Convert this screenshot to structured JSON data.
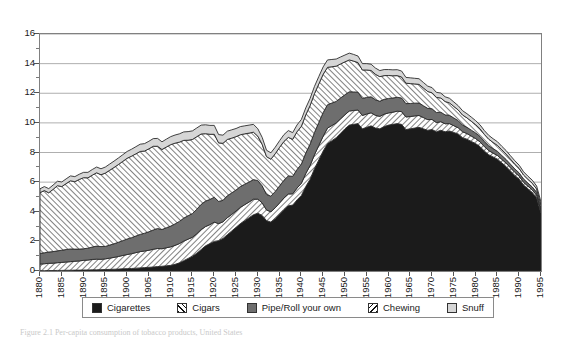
{
  "chart_data": {
    "type": "area",
    "stacked": true,
    "title": "",
    "xlabel": "",
    "ylabel": "",
    "xlim": [
      1880,
      1995
    ],
    "ylim": [
      0,
      16
    ],
    "ytick_major": [
      0,
      2,
      4,
      6,
      8,
      10,
      12,
      14,
      16
    ],
    "ytick_minor": [
      1,
      3,
      5,
      7,
      9,
      11,
      13,
      15
    ],
    "xticks": [
      1880,
      1885,
      1890,
      1895,
      1900,
      1905,
      1910,
      1915,
      1920,
      1925,
      1930,
      1935,
      1940,
      1945,
      1950,
      1955,
      1960,
      1965,
      1970,
      1975,
      1980,
      1985,
      1990,
      1995
    ],
    "grid": "horizontal",
    "legend_position": "below",
    "colors": {
      "cigarettes": "#1b1b1b",
      "cigars": "#ffffff",
      "pipe": "#6e6e6e",
      "chewing": "#ffffff",
      "snuff": "#d6d6d6",
      "frame": "#808080",
      "gridline": "#9a9a9a"
    },
    "x": [
      1880,
      1881,
      1882,
      1883,
      1884,
      1885,
      1886,
      1887,
      1888,
      1889,
      1890,
      1891,
      1892,
      1893,
      1894,
      1895,
      1896,
      1897,
      1898,
      1899,
      1900,
      1901,
      1902,
      1903,
      1904,
      1905,
      1906,
      1907,
      1908,
      1909,
      1910,
      1911,
      1912,
      1913,
      1914,
      1915,
      1916,
      1917,
      1918,
      1919,
      1920,
      1921,
      1922,
      1923,
      1924,
      1925,
      1926,
      1927,
      1928,
      1929,
      1930,
      1931,
      1932,
      1933,
      1934,
      1935,
      1936,
      1937,
      1938,
      1939,
      1940,
      1941,
      1942,
      1943,
      1944,
      1945,
      1946,
      1947,
      1948,
      1949,
      1950,
      1951,
      1952,
      1953,
      1954,
      1955,
      1956,
      1957,
      1958,
      1959,
      1960,
      1961,
      1962,
      1963,
      1964,
      1965,
      1966,
      1967,
      1968,
      1969,
      1970,
      1971,
      1972,
      1973,
      1974,
      1975,
      1976,
      1977,
      1978,
      1979,
      1980,
      1981,
      1982,
      1983,
      1984,
      1985,
      1986,
      1987,
      1988,
      1989,
      1990,
      1991,
      1992,
      1993,
      1994,
      1995
    ],
    "series": [
      {
        "name": "Cigarettes",
        "pattern": "solid-black",
        "values": [
          0.02,
          0.02,
          0.03,
          0.03,
          0.04,
          0.04,
          0.05,
          0.05,
          0.06,
          0.06,
          0.07,
          0.07,
          0.08,
          0.08,
          0.09,
          0.1,
          0.11,
          0.12,
          0.13,
          0.15,
          0.16,
          0.17,
          0.19,
          0.21,
          0.23,
          0.25,
          0.27,
          0.3,
          0.32,
          0.35,
          0.38,
          0.45,
          0.55,
          0.7,
          0.85,
          1.0,
          1.2,
          1.45,
          1.7,
          1.85,
          2.0,
          2.05,
          2.2,
          2.45,
          2.7,
          2.95,
          3.2,
          3.4,
          3.6,
          3.8,
          3.9,
          3.75,
          3.4,
          3.3,
          3.55,
          3.85,
          4.15,
          4.4,
          4.45,
          4.8,
          5.1,
          5.7,
          6.2,
          6.9,
          7.5,
          8.1,
          8.6,
          8.8,
          9.0,
          9.3,
          9.6,
          9.85,
          9.9,
          9.95,
          9.6,
          9.7,
          9.8,
          9.65,
          9.6,
          9.75,
          9.85,
          9.9,
          9.95,
          9.9,
          9.55,
          9.6,
          9.65,
          9.7,
          9.6,
          9.5,
          9.55,
          9.4,
          9.5,
          9.4,
          9.45,
          9.35,
          9.25,
          9.0,
          8.9,
          8.75,
          8.6,
          8.4,
          8.1,
          7.85,
          7.7,
          7.55,
          7.3,
          7.05,
          6.75,
          6.45,
          6.2,
          5.8,
          5.55,
          5.3,
          4.95,
          3.9
        ]
      },
      {
        "name": "Cigars",
        "pattern": "hatch-45",
        "values": [
          0.45,
          0.47,
          0.49,
          0.5,
          0.52,
          0.54,
          0.56,
          0.58,
          0.6,
          0.62,
          0.65,
          0.67,
          0.7,
          0.72,
          0.7,
          0.72,
          0.76,
          0.8,
          0.85,
          0.9,
          0.95,
          1.0,
          1.05,
          1.1,
          1.12,
          1.15,
          1.2,
          1.22,
          1.18,
          1.22,
          1.25,
          1.28,
          1.3,
          1.32,
          1.3,
          1.28,
          1.32,
          1.35,
          1.3,
          1.28,
          1.3,
          1.15,
          1.12,
          1.15,
          1.12,
          1.1,
          1.1,
          1.08,
          1.06,
          1.05,
          0.95,
          0.85,
          0.72,
          0.7,
          0.72,
          0.75,
          0.78,
          0.8,
          0.76,
          0.8,
          0.82,
          0.88,
          0.92,
          0.95,
          0.98,
          1.0,
          1.05,
          1.02,
          1.0,
          0.98,
          0.95,
          0.95,
          0.94,
          0.92,
          0.9,
          0.9,
          0.88,
          0.86,
          0.84,
          0.84,
          0.82,
          0.82,
          0.84,
          0.86,
          0.85,
          0.83,
          0.82,
          0.8,
          0.76,
          0.72,
          0.68,
          0.62,
          0.58,
          0.54,
          0.5,
          0.46,
          0.42,
          0.4,
          0.38,
          0.36,
          0.34,
          0.32,
          0.3,
          0.28,
          0.26,
          0.25,
          0.24,
          0.23,
          0.22,
          0.21,
          0.2,
          0.19,
          0.18,
          0.18,
          0.17,
          0.16
        ]
      },
      {
        "name": "Pipe/Roll your own",
        "pattern": "solid-gray",
        "values": [
          0.72,
          0.74,
          0.76,
          0.78,
          0.8,
          0.82,
          0.84,
          0.86,
          0.82,
          0.8,
          0.78,
          0.8,
          0.84,
          0.88,
          0.86,
          0.84,
          0.88,
          0.92,
          0.96,
          1.0,
          1.05,
          1.08,
          1.12,
          1.16,
          1.2,
          1.25,
          1.3,
          1.35,
          1.3,
          1.35,
          1.4,
          1.45,
          1.5,
          1.55,
          1.58,
          1.6,
          1.65,
          1.7,
          1.72,
          1.7,
          1.68,
          1.5,
          1.45,
          1.48,
          1.45,
          1.42,
          1.4,
          1.38,
          1.35,
          1.32,
          1.25,
          1.15,
          1.05,
          1.05,
          1.1,
          1.15,
          1.2,
          1.22,
          1.18,
          1.25,
          1.3,
          1.38,
          1.45,
          1.5,
          1.55,
          1.6,
          1.58,
          1.52,
          1.45,
          1.4,
          1.35,
          1.3,
          1.25,
          1.2,
          1.15,
          1.12,
          1.08,
          1.05,
          1.02,
          1.0,
          0.98,
          0.96,
          0.94,
          0.92,
          0.9,
          0.88,
          0.86,
          0.84,
          0.8,
          0.76,
          0.72,
          0.68,
          0.64,
          0.6,
          0.56,
          0.52,
          0.48,
          0.45,
          0.42,
          0.4,
          0.38,
          0.36,
          0.34,
          0.32,
          0.3,
          0.28,
          0.26,
          0.25,
          0.24,
          0.23,
          0.22,
          0.21,
          0.2,
          0.19,
          0.18,
          0.17
        ]
      },
      {
        "name": "Chewing",
        "pattern": "hatch-135",
        "values": [
          4.1,
          4.2,
          4.0,
          4.2,
          4.4,
          4.3,
          4.45,
          4.6,
          4.55,
          4.7,
          4.8,
          4.75,
          4.85,
          4.95,
          4.85,
          4.95,
          5.05,
          5.15,
          5.25,
          5.35,
          5.45,
          5.5,
          5.55,
          5.6,
          5.55,
          5.6,
          5.65,
          5.55,
          5.4,
          5.45,
          5.5,
          5.45,
          5.35,
          5.25,
          5.1,
          5.0,
          4.9,
          4.75,
          4.55,
          4.4,
          4.25,
          3.95,
          3.85,
          3.8,
          3.7,
          3.6,
          3.5,
          3.4,
          3.3,
          3.2,
          3.0,
          2.8,
          2.55,
          2.5,
          2.55,
          2.6,
          2.62,
          2.6,
          2.5,
          2.55,
          2.55,
          2.58,
          2.6,
          2.62,
          2.6,
          2.58,
          2.52,
          2.45,
          2.38,
          2.3,
          2.22,
          2.15,
          2.08,
          2.0,
          1.92,
          1.85,
          1.78,
          1.72,
          1.66,
          1.6,
          1.55,
          1.5,
          1.46,
          1.42,
          1.38,
          1.34,
          1.3,
          1.26,
          1.2,
          1.14,
          1.08,
          1.02,
          0.96,
          0.9,
          0.84,
          0.78,
          0.72,
          0.68,
          0.64,
          0.6,
          0.56,
          0.52,
          0.48,
          0.45,
          0.42,
          0.4,
          0.38,
          0.36,
          0.34,
          0.32,
          0.3,
          0.28,
          0.26,
          0.25,
          0.24,
          0.23
        ]
      },
      {
        "name": "Snuff",
        "pattern": "solid-light",
        "values": [
          0.26,
          0.27,
          0.28,
          0.29,
          0.3,
          0.31,
          0.32,
          0.33,
          0.34,
          0.35,
          0.36,
          0.37,
          0.38,
          0.39,
          0.4,
          0.41,
          0.42,
          0.43,
          0.44,
          0.45,
          0.46,
          0.47,
          0.48,
          0.49,
          0.5,
          0.51,
          0.52,
          0.53,
          0.52,
          0.53,
          0.54,
          0.55,
          0.56,
          0.57,
          0.58,
          0.58,
          0.59,
          0.6,
          0.6,
          0.6,
          0.6,
          0.56,
          0.55,
          0.56,
          0.56,
          0.55,
          0.55,
          0.54,
          0.54,
          0.53,
          0.5,
          0.47,
          0.43,
          0.43,
          0.44,
          0.45,
          0.46,
          0.46,
          0.45,
          0.46,
          0.46,
          0.47,
          0.48,
          0.49,
          0.5,
          0.5,
          0.5,
          0.49,
          0.48,
          0.47,
          0.46,
          0.46,
          0.45,
          0.44,
          0.43,
          0.43,
          0.42,
          0.42,
          0.41,
          0.41,
          0.4,
          0.4,
          0.4,
          0.4,
          0.39,
          0.39,
          0.38,
          0.38,
          0.37,
          0.36,
          0.35,
          0.34,
          0.33,
          0.32,
          0.31,
          0.3,
          0.29,
          0.29,
          0.28,
          0.28,
          0.27,
          0.27,
          0.26,
          0.26,
          0.25,
          0.25,
          0.24,
          0.24,
          0.23,
          0.23,
          0.22,
          0.22,
          0.21,
          0.21,
          0.2,
          0.2
        ]
      }
    ]
  },
  "legend": {
    "items": [
      {
        "label": "Cigarettes",
        "swatch": "cigarettes-swatch"
      },
      {
        "label": "Cigars",
        "swatch": "cigars-swatch"
      },
      {
        "label": "Pipe/Roll your own",
        "swatch": "pipe-swatch"
      },
      {
        "label": "Chewing",
        "swatch": "chewing-swatch"
      },
      {
        "label": "Snuff",
        "swatch": "snuff-swatch"
      }
    ]
  },
  "caption": {
    "text": "Figure 2.1 Per-capita consumption of tobacco products, United States"
  }
}
